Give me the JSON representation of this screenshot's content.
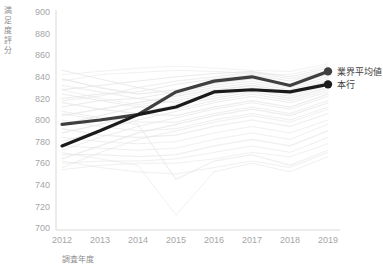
{
  "chart_data": {
    "type": "line",
    "title": "",
    "xlabel": "調査年度",
    "ylabel": "満足度評分",
    "categories": [
      "2012",
      "2013",
      "2014",
      "2015",
      "2016",
      "2017",
      "2018",
      "2019"
    ],
    "x": [
      2012,
      2013,
      2014,
      2015,
      2016,
      2017,
      2018,
      2019
    ],
    "ylim": [
      700,
      900
    ],
    "ytick_labels": [
      "900",
      "880",
      "860",
      "840",
      "820",
      "800",
      "780",
      "760",
      "740",
      "720",
      "700"
    ],
    "ytick_values": [
      900,
      880,
      860,
      840,
      820,
      800,
      780,
      760,
      740,
      720,
      700
    ],
    "ystep": 20,
    "grid": false,
    "legend_position": "right-of-plot-end-labels",
    "series": [
      {
        "name": "業界平均値",
        "color": "#3f3f3f",
        "emphasis": true,
        "end_marker": true,
        "values": [
          796,
          800,
          805,
          826,
          836,
          840,
          832,
          845
        ]
      },
      {
        "name": "本行",
        "color": "#1a1a1a",
        "emphasis": true,
        "end_marker": true,
        "values": [
          776,
          790,
          805,
          812,
          826,
          828,
          826,
          833
        ]
      }
    ],
    "background_series_color": "#e6e6e6",
    "background_series_note": "其他同業銀行折線（淡灰色）",
    "background_series": [
      {
        "name": "bank-01",
        "values": [
          842,
          845,
          848,
          850,
          848,
          846,
          845,
          852
        ]
      },
      {
        "name": "bank-02",
        "values": [
          828,
          832,
          836,
          840,
          843,
          845,
          840,
          848
        ]
      },
      {
        "name": "bank-03",
        "values": [
          820,
          824,
          826,
          833,
          838,
          842,
          836,
          845
        ]
      },
      {
        "name": "bank-04",
        "values": [
          838,
          830,
          824,
          828,
          834,
          838,
          833,
          842
        ]
      },
      {
        "name": "bank-05",
        "values": [
          812,
          818,
          820,
          826,
          832,
          836,
          830,
          840
        ]
      },
      {
        "name": "bank-06",
        "values": [
          846,
          838,
          830,
          824,
          830,
          834,
          828,
          838
        ]
      },
      {
        "name": "bank-07",
        "values": [
          804,
          810,
          816,
          822,
          828,
          832,
          826,
          836
        ]
      },
      {
        "name": "bank-08",
        "values": [
          796,
          804,
          812,
          818,
          824,
          830,
          824,
          834
        ]
      },
      {
        "name": "bank-09",
        "values": [
          832,
          826,
          820,
          816,
          822,
          828,
          822,
          832
        ]
      },
      {
        "name": "bank-10",
        "values": [
          788,
          796,
          806,
          814,
          820,
          826,
          820,
          830
        ]
      },
      {
        "name": "bank-11",
        "values": [
          824,
          818,
          812,
          810,
          818,
          824,
          818,
          828
        ]
      },
      {
        "name": "bank-12",
        "values": [
          780,
          790,
          800,
          808,
          816,
          822,
          816,
          826
        ]
      },
      {
        "name": "bank-13",
        "values": [
          816,
          810,
          806,
          804,
          812,
          818,
          812,
          824
        ]
      },
      {
        "name": "bank-14",
        "values": [
          772,
          784,
          794,
          802,
          810,
          816,
          810,
          822
        ]
      },
      {
        "name": "bank-15",
        "values": [
          808,
          802,
          798,
          798,
          806,
          812,
          806,
          818
        ]
      },
      {
        "name": "bank-16",
        "values": [
          764,
          776,
          788,
          796,
          804,
          810,
          804,
          816
        ]
      },
      {
        "name": "bank-17",
        "values": [
          800,
          794,
          790,
          792,
          800,
          806,
          800,
          812
        ]
      },
      {
        "name": "bank-18",
        "values": [
          756,
          770,
          782,
          790,
          798,
          804,
          798,
          810
        ]
      },
      {
        "name": "bank-19",
        "values": [
          792,
          786,
          784,
          786,
          794,
          800,
          794,
          806
        ]
      },
      {
        "name": "bank-20",
        "values": [
          784,
          780,
          778,
          780,
          788,
          794,
          788,
          800
        ]
      },
      {
        "name": "bank-21",
        "values": [
          776,
          774,
          772,
          774,
          782,
          788,
          782,
          796
        ]
      },
      {
        "name": "bank-22",
        "values": [
          768,
          768,
          766,
          768,
          776,
          782,
          776,
          790
        ]
      },
      {
        "name": "bank-23",
        "values": [
          760,
          762,
          762,
          764,
          770,
          776,
          770,
          784
        ]
      },
      {
        "name": "bank-24",
        "values": [
          754,
          758,
          760,
          760,
          764,
          770,
          766,
          778
        ]
      },
      {
        "name": "bank-25",
        "values": [
          806,
          800,
          796,
          745,
          762,
          768,
          758,
          772
        ]
      },
      {
        "name": "bank-26",
        "values": [
          770,
          764,
          758,
          712,
          752,
          760,
          752,
          766
        ]
      },
      {
        "name": "bank-27",
        "values": [
          762,
          756,
          752,
          750,
          756,
          762,
          756,
          770
        ]
      },
      {
        "name": "bank-28",
        "values": [
          818,
          822,
          830,
          836,
          840,
          844,
          838,
          846
        ]
      },
      {
        "name": "bank-29",
        "values": [
          836,
          842,
          844,
          846,
          845,
          843,
          842,
          850
        ]
      },
      {
        "name": "bank-30",
        "values": [
          828,
          820,
          814,
          820,
          826,
          832,
          826,
          836
        ]
      }
    ]
  },
  "axis": {
    "y_title": "満足度評分",
    "x_title": "調査年度"
  },
  "legend": {
    "items": [
      {
        "label": "業界平均値",
        "color": "#3f3f3f"
      },
      {
        "label": "本行",
        "color": "#1a1a1a"
      }
    ]
  }
}
